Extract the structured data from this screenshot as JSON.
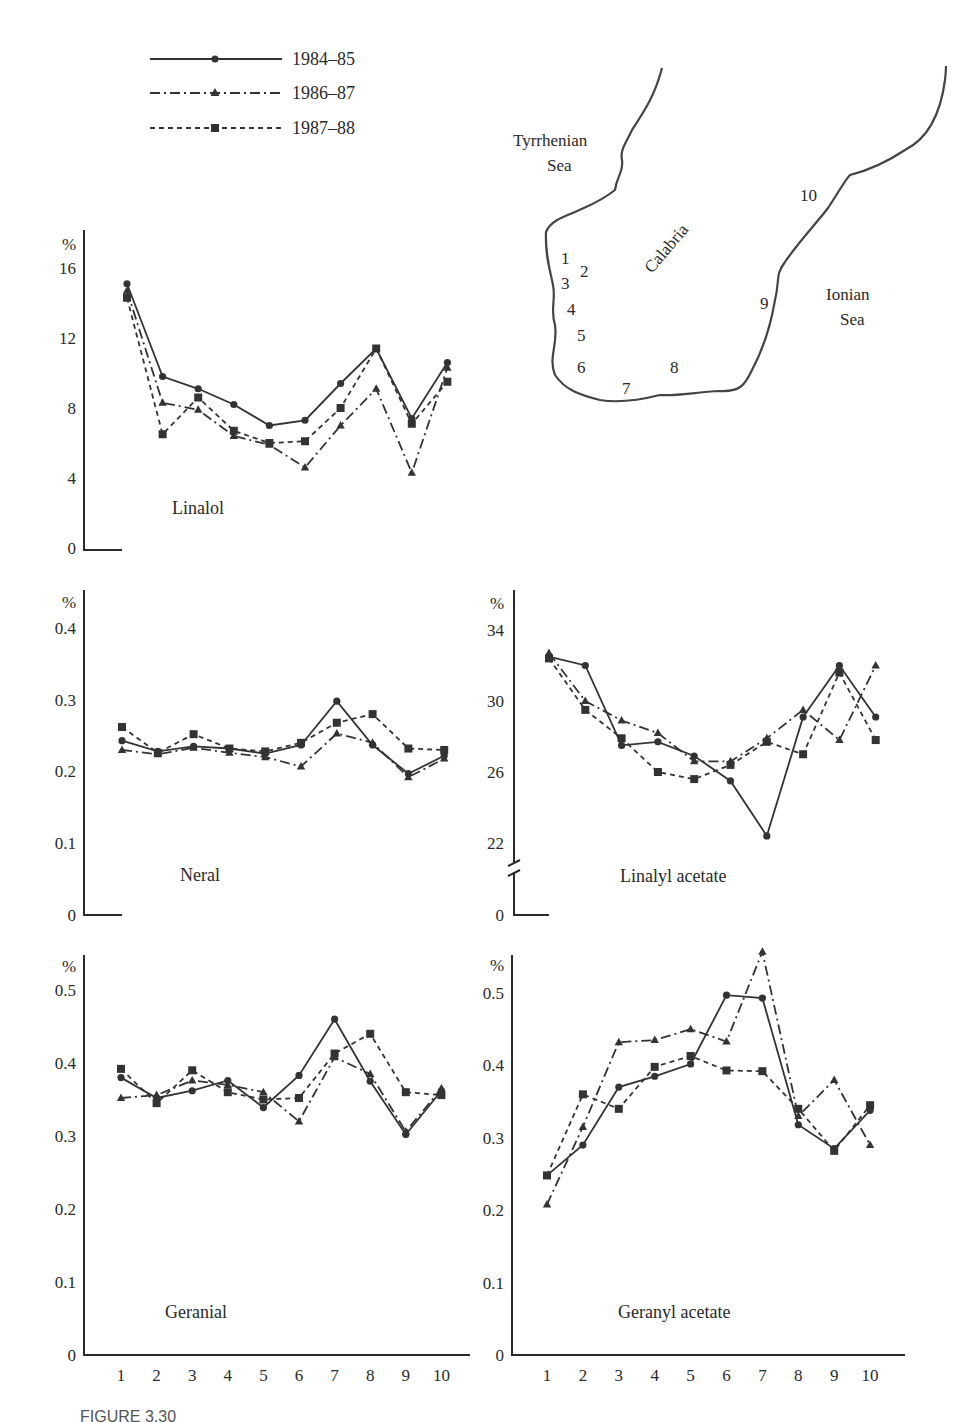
{
  "legend": [
    {
      "label": "1984–85",
      "style": "solid",
      "marker": "circle"
    },
    {
      "label": "1986–87",
      "style": "dashdot",
      "marker": "triangle"
    },
    {
      "label": "1987–88",
      "style": "dashed",
      "marker": "square"
    }
  ],
  "map": {
    "labels": {
      "tyrrhenian_1": "Tyrrhenian",
      "tyrrhenian_2": "Sea",
      "ionian_1": "Ionian",
      "ionian_2": "Sea",
      "region": "Calabria"
    },
    "sites": [
      "1",
      "2",
      "3",
      "4",
      "5",
      "6",
      "7",
      "8",
      "9",
      "10"
    ]
  },
  "axis": {
    "percent": "%",
    "x_ticks": [
      "1",
      "2",
      "3",
      "4",
      "5",
      "6",
      "7",
      "8",
      "9",
      "10"
    ]
  },
  "caption": "FIGURE 3.30",
  "chart_data": [
    {
      "type": "line",
      "title": "Linalol",
      "xlabel": "",
      "ylabel": "%",
      "categories": [
        1,
        2,
        3,
        4,
        5,
        6,
        7,
        8,
        9,
        10
      ],
      "y_ticks": [
        "0",
        "4",
        "8",
        "12",
        "16"
      ],
      "ylim": [
        0,
        16
      ],
      "series": [
        {
          "name": "1984–85",
          "values": [
            15.1,
            9.8,
            9.1,
            8.2,
            7.0,
            7.3,
            9.4,
            11.4,
            7.4,
            10.6
          ]
        },
        {
          "name": "1986–87",
          "values": [
            14.7,
            8.3,
            7.9,
            6.4,
            5.9,
            4.6,
            7.0,
            9.1,
            4.3,
            10.3
          ]
        },
        {
          "name": "1987–88",
          "values": [
            14.3,
            6.5,
            8.6,
            6.7,
            6.0,
            6.1,
            8.0,
            11.4,
            7.1,
            9.5
          ]
        }
      ]
    },
    {
      "type": "line",
      "title": "Neral",
      "xlabel": "",
      "ylabel": "%",
      "categories": [
        1,
        2,
        3,
        4,
        5,
        6,
        7,
        8,
        9,
        10
      ],
      "y_ticks": [
        "0",
        "0.1",
        "0.2",
        "0.3",
        "0.4"
      ],
      "ylim": [
        0,
        0.4
      ],
      "series": [
        {
          "name": "1984–85",
          "values": [
            0.243,
            0.228,
            0.235,
            0.232,
            0.225,
            0.237,
            0.298,
            0.237,
            0.197,
            0.222
          ]
        },
        {
          "name": "1986–87",
          "values": [
            0.23,
            0.224,
            0.233,
            0.226,
            0.22,
            0.207,
            0.253,
            0.24,
            0.192,
            0.218
          ]
        },
        {
          "name": "1987–88",
          "values": [
            0.262,
            0.226,
            0.252,
            0.232,
            0.228,
            0.24,
            0.268,
            0.28,
            0.232,
            0.23
          ]
        }
      ]
    },
    {
      "type": "line",
      "title": "Linalyl acetate",
      "xlabel": "",
      "ylabel": "%",
      "categories": [
        1,
        2,
        3,
        4,
        5,
        6,
        7,
        8,
        9,
        10
      ],
      "y_ticks": [
        "0",
        "22",
        "26",
        "30",
        "34"
      ],
      "ylim": [
        22,
        34
      ],
      "axis_break": true,
      "series": [
        {
          "name": "1984–85",
          "values": [
            32.5,
            32.0,
            27.5,
            27.7,
            26.9,
            25.5,
            22.4,
            29.1,
            32.0,
            29.1
          ]
        },
        {
          "name": "1986–87",
          "values": [
            32.7,
            30.0,
            28.9,
            28.2,
            26.6,
            26.6,
            27.9,
            29.5,
            27.8,
            32.0
          ]
        },
        {
          "name": "1987–88",
          "values": [
            32.4,
            29.5,
            27.9,
            26.0,
            25.6,
            26.4,
            27.7,
            27.0,
            31.6,
            27.8
          ]
        }
      ]
    },
    {
      "type": "line",
      "title": "Geranial",
      "xlabel": "",
      "ylabel": "%",
      "categories": [
        1,
        2,
        3,
        4,
        5,
        6,
        7,
        8,
        9,
        10
      ],
      "y_ticks": [
        "0",
        "0.1",
        "0.2",
        "0.3",
        "0.4",
        "0.5"
      ],
      "ylim": [
        0,
        0.5
      ],
      "series": [
        {
          "name": "1984–85",
          "values": [
            0.38,
            0.352,
            0.362,
            0.376,
            0.339,
            0.383,
            0.46,
            0.375,
            0.302,
            0.362
          ]
        },
        {
          "name": "1986–87",
          "values": [
            0.352,
            0.356,
            0.376,
            0.37,
            0.36,
            0.32,
            0.408,
            0.385,
            0.306,
            0.365
          ]
        },
        {
          "name": "1987–88",
          "values": [
            0.392,
            0.345,
            0.39,
            0.36,
            0.35,
            0.352,
            0.413,
            0.44,
            0.36,
            0.356
          ]
        }
      ]
    },
    {
      "type": "line",
      "title": "Geranyl acetate",
      "xlabel": "",
      "ylabel": "%",
      "categories": [
        1,
        2,
        3,
        4,
        5,
        6,
        7,
        8,
        9,
        10
      ],
      "y_ticks": [
        "0",
        "0.1",
        "0.2",
        "0.3",
        "0.4",
        "0.5"
      ],
      "ylim": [
        0,
        0.5
      ],
      "series": [
        {
          "name": "1984–85",
          "values": [
            0.248,
            0.29,
            0.37,
            0.385,
            0.402,
            0.497,
            0.493,
            0.318,
            0.285,
            0.338
          ]
        },
        {
          "name": "1986–87",
          "values": [
            0.208,
            0.315,
            0.432,
            0.435,
            0.45,
            0.433,
            0.557,
            0.33,
            0.38,
            0.29
          ]
        },
        {
          "name": "1987–88",
          "values": [
            0.248,
            0.36,
            0.34,
            0.398,
            0.413,
            0.393,
            0.392,
            0.34,
            0.282,
            0.345
          ]
        }
      ]
    }
  ]
}
